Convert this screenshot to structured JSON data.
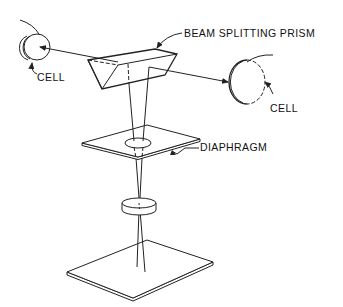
{
  "diagram": {
    "type": "optical-schematic",
    "labels": {
      "prism": "BEAM SPLITTING PRISM",
      "left_cell": "CELL",
      "right_cell": "CELL",
      "diaphragm": "DIAPHRAGM"
    },
    "components": [
      {
        "id": "left-cell",
        "label": "CELL"
      },
      {
        "id": "beam-splitting-prism",
        "label": "BEAM SPLITTING PRISM"
      },
      {
        "id": "right-cell",
        "label": "CELL"
      },
      {
        "id": "diaphragm",
        "label": "DIAPHRAGM"
      },
      {
        "id": "lens",
        "label": ""
      },
      {
        "id": "base-plate",
        "label": ""
      }
    ],
    "colors": {
      "line": "#222222",
      "background": "#ffffff"
    }
  }
}
